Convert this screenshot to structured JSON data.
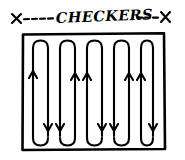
{
  "title": {
    "full_text": "X----CHECKERS---X",
    "left_marker": "X",
    "left_dashes": "----",
    "label": "CHECKERS",
    "right_dashes": "---",
    "right_marker": "X"
  },
  "colors": {
    "ink": "#000000",
    "background": "#ffffff"
  },
  "diagram": {
    "kind": "boustrophedon-coverage-path",
    "boundary": {
      "x": 22,
      "y": 33,
      "width": 143,
      "height": 117
    },
    "column_count": 8,
    "column_x": [
      33,
      48,
      60,
      75,
      87,
      102,
      114,
      129,
      141,
      153
    ],
    "columns": [
      {
        "x": 33,
        "direction": "up"
      },
      {
        "x": 48,
        "direction": "down"
      },
      {
        "x": 63,
        "direction": "up"
      },
      {
        "x": 78,
        "direction": "down"
      },
      {
        "x": 93,
        "direction": "up"
      },
      {
        "x": 108,
        "direction": "down"
      },
      {
        "x": 123,
        "direction": "up"
      },
      {
        "x": 138,
        "direction": "down"
      }
    ],
    "top_turns": 4,
    "bottom_turns": 4,
    "arrow_up_count": 4,
    "arrow_down_count": 4,
    "path_top_y": 44,
    "path_bottom_y": 140
  }
}
